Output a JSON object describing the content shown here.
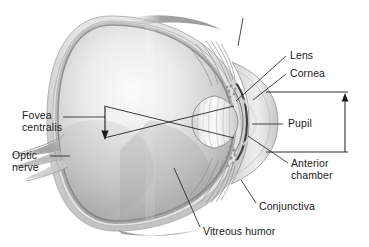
{
  "figure": {
    "kind": "anatomical-illustration",
    "style": "grayscale-airbrush-pencil",
    "background_color": "#ffffff",
    "ink_color": "#1b1b1b"
  },
  "labels": {
    "lens": "Lens",
    "cornea": "Cornea",
    "pupil": "Pupil",
    "anterior_chamber_line1": "Anterior",
    "anterior_chamber_line2": "chamber",
    "conjunctiva": "Conjunctiva",
    "vitreous_humor": "Vitreous humor",
    "fovea_line1": "Fovea",
    "fovea_line2": "centralis",
    "optic_nerve_line1": "Optic",
    "optic_nerve_line2": "nerve"
  },
  "annotations": {
    "light_rays": "two crossing light ray lines from lens to retina",
    "fovea_arrow": "downward arrow marking fovea centralis on retina",
    "dimension_bracket": "vertical dimension arrow at right with upper and lower extension lines"
  },
  "palette": {
    "ink": "#1b1b1b",
    "sclera_outer": "#d8d8d8",
    "sclera_mid": "#bfbfbf",
    "wall_dark": "#8a8a8a",
    "interior_light": "#f2f2f2",
    "interior_mid": "#c9c9c9",
    "interior_shadow": "#a8a8a8",
    "lens_light": "#f4f4f4",
    "lens_mid": "#d2d2d2",
    "nerve": "#a9a9a9",
    "leader": "#2a2a2a"
  }
}
